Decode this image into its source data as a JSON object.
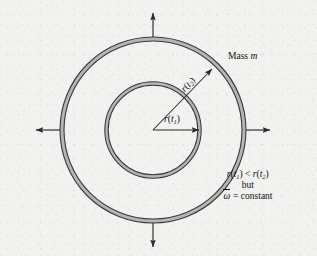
{
  "figure": {
    "name": "rotating-mass-angular-velocity-diagram",
    "background_color": "#f2f2f0",
    "ring_fill_color": "#b5b5b5",
    "ring_stroke_color": "#3a3a3a",
    "arrow_color": "#2b2b2b"
  },
  "geometry": {
    "center_x": 153,
    "center_y": 130,
    "outer_radius": 93,
    "inner_radius": 48,
    "ring_band_width": 4
  },
  "labels": {
    "mass": {
      "text_plain": "Mass m",
      "prefix": "Mass ",
      "symbol": "m"
    },
    "radius_outer": {
      "text_plain": "r(t2)",
      "fn": "r",
      "open": "(",
      "var": "t",
      "index": "2",
      "close": ")"
    },
    "radius_inner": {
      "text_plain": "r(t1)",
      "fn": "r",
      "open": "(",
      "var": "t",
      "index": "1",
      "close": ")"
    }
  },
  "note": {
    "line1": {
      "text_plain": "r(t1) < r(t2)",
      "fn": "r",
      "open": "(",
      "var": "t",
      "index1": "1",
      "close": ")",
      "relation": " < ",
      "index2": "2"
    },
    "line2": {
      "text_plain": "but"
    },
    "line3": {
      "text_plain": "omega-bar = constant",
      "symbol": "ω",
      "equals": " = ",
      "value": "constant"
    }
  },
  "arrows": {
    "up": "arrow-up",
    "down": "arrow-down",
    "left": "arrow-left",
    "right": "arrow-right",
    "radius_outer": "arrow-radius-outer",
    "radius_inner": "arrow-radius-inner"
  }
}
